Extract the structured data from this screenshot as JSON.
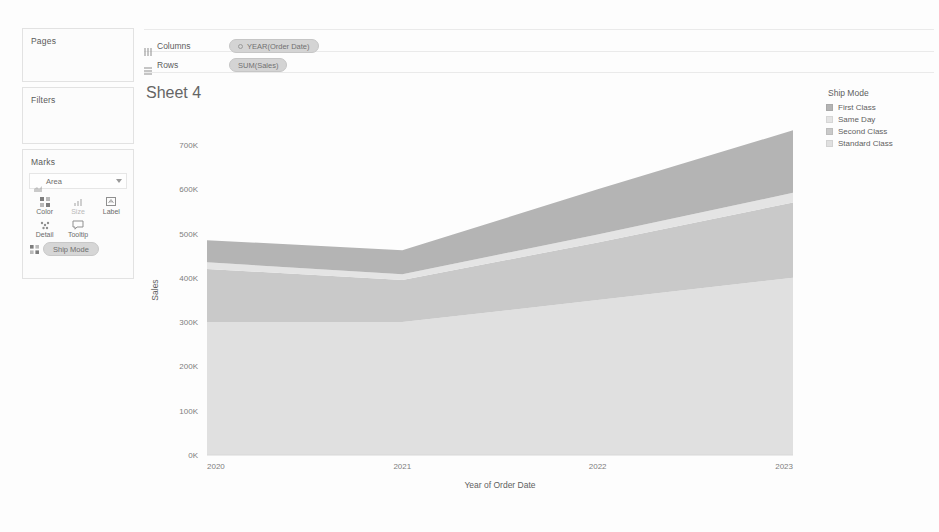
{
  "sheet": {
    "title": "Sheet 4"
  },
  "sidebar": {
    "pages": {
      "title": "Pages"
    },
    "filters": {
      "title": "Filters"
    },
    "marks": {
      "title": "Marks",
      "type_label": "Area",
      "type_icon": "area-mark-icon",
      "caret_icon": "chevron-down-icon",
      "buttons": [
        {
          "label": "Color",
          "icon": "color-icon",
          "enabled": true
        },
        {
          "label": "Size",
          "icon": "size-icon",
          "enabled": false
        },
        {
          "label": "Label",
          "icon": "label-icon",
          "enabled": true
        },
        {
          "label": "Detail",
          "icon": "detail-icon",
          "enabled": true
        },
        {
          "label": "Tooltip",
          "icon": "tooltip-icon",
          "enabled": true
        }
      ],
      "pills": [
        {
          "label": "Ship Mode",
          "icon": "color-icon"
        }
      ]
    }
  },
  "shelves": {
    "columns": {
      "label": "Columns",
      "icon": "columns-shelf-icon",
      "pills": [
        {
          "label": "YEAR(Order Date)",
          "icon": "date-pill-icon"
        }
      ]
    },
    "rows": {
      "label": "Rows",
      "icon": "rows-shelf-icon",
      "pills": [
        {
          "label": "SUM(Sales)",
          "icon": "measure-pill-icon"
        }
      ]
    }
  },
  "legend": {
    "title": "Ship Mode",
    "items": [
      {
        "label": "First Class",
        "color": "#b4b4b4"
      },
      {
        "label": "Same Day",
        "color": "#e4e4e4"
      },
      {
        "label": "Second Class",
        "color": "#c9c9c9"
      },
      {
        "label": "Standard Class",
        "color": "#e0e0e0"
      }
    ]
  },
  "chart_data": {
    "type": "area",
    "title": "Sheet 4",
    "xlabel": "Year of Order Date",
    "ylabel": "Sales",
    "x": [
      "2020",
      "2021",
      "2022",
      "2023"
    ],
    "categories": [
      "2020",
      "2021",
      "2022",
      "2023"
    ],
    "xtick_labels": [
      "2020",
      "2021",
      "2022",
      "2023"
    ],
    "ytick_labels": [
      "0K",
      "100K",
      "200K",
      "300K",
      "400K",
      "500K",
      "600K",
      "700K"
    ],
    "ytick_values": [
      0,
      100000,
      200000,
      300000,
      400000,
      500000,
      600000,
      700000
    ],
    "ylim": [
      0,
      745000
    ],
    "stacked": true,
    "grid": false,
    "legend_position": "right",
    "series": [
      {
        "name": "Standard Class",
        "color": "#e0e0e0",
        "values": [
          300000,
          300000,
          350000,
          400000
        ]
      },
      {
        "name": "Second Class",
        "color": "#c9c9c9",
        "values": [
          120000,
          95000,
          130000,
          170000
        ]
      },
      {
        "name": "Same Day",
        "color": "#e4e4e4",
        "values": [
          15000,
          13000,
          18000,
          22000
        ]
      },
      {
        "name": "First Class",
        "color": "#b4b4b4",
        "values": [
          50000,
          54000,
          102000,
          141000
        ]
      }
    ],
    "cumulative_totals": [
      485000,
      462000,
      600000,
      733000
    ]
  }
}
